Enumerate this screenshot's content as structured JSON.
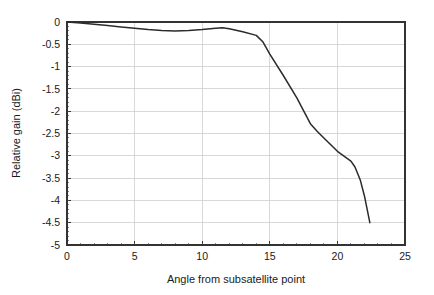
{
  "chart_data": {
    "type": "line",
    "title": "",
    "xlabel": "Angle from subsatellite point",
    "ylabel": "Relative gain (dBi)",
    "xlim": [
      0,
      25
    ],
    "ylim": [
      -5,
      0
    ],
    "grid": true,
    "legend": null,
    "x_ticks": [
      0,
      5,
      10,
      15,
      20,
      25
    ],
    "x_tick_labels": [
      "0",
      "5",
      "10",
      "15",
      "20",
      "25"
    ],
    "x_minor_tick_step": 1,
    "y_ticks": [
      0,
      -0.5,
      -1,
      -1.5,
      -2,
      -2.5,
      -3,
      -3.5,
      -4,
      -4.5,
      -5
    ],
    "y_tick_labels": [
      "0",
      "-0.5",
      "-1",
      "-1.5",
      "-2",
      "-2.5",
      "-3",
      "-3.5",
      "-4",
      "-4.5",
      "-5"
    ],
    "series": [
      {
        "name": "Relative gain",
        "color": "#2b2b2b",
        "x": [
          0,
          1,
          2,
          3,
          4,
          5,
          6,
          7,
          8,
          9,
          10,
          11,
          11.5,
          12,
          13,
          14,
          14.5,
          15,
          16,
          17,
          18,
          18.5,
          19,
          20,
          21,
          21.3,
          21.7,
          22,
          22.4
        ],
        "y": [
          0,
          -0.02,
          -0.05,
          -0.08,
          -0.11,
          -0.14,
          -0.17,
          -0.19,
          -0.2,
          -0.19,
          -0.17,
          -0.14,
          -0.13,
          -0.15,
          -0.22,
          -0.3,
          -0.45,
          -0.72,
          -1.2,
          -1.7,
          -2.28,
          -2.45,
          -2.6,
          -2.9,
          -3.12,
          -3.25,
          -3.55,
          -3.9,
          -4.5
        ]
      }
    ]
  },
  "axes": {
    "x_axis_label": "Angle from subsatellite point",
    "y_axis_label": "Relative gain (dBi)"
  }
}
